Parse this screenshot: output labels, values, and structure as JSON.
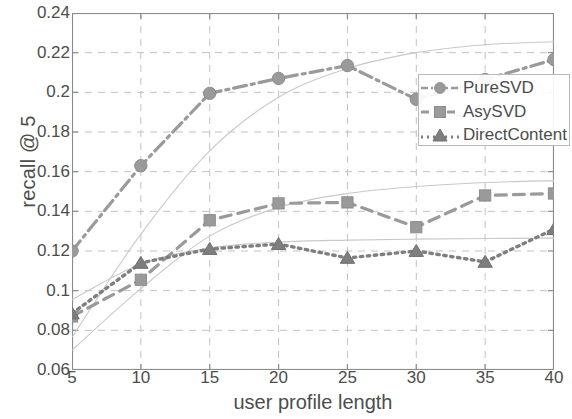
{
  "chart_data": {
    "type": "line",
    "title": "",
    "xlabel": "user profile length",
    "ylabel": "recall @ 5",
    "x": [
      5,
      10,
      15,
      20,
      25,
      30,
      35,
      40
    ],
    "xticklabels": [
      "5",
      "10",
      "15",
      "20",
      "25",
      "30",
      "35",
      "40"
    ],
    "yticklabels": [
      "0.06",
      "0.08",
      "0.1",
      "0.12",
      "0.14",
      "0.16",
      "0.18",
      "0.2",
      "0.22",
      "0.24"
    ],
    "yticks": [
      0.06,
      0.08,
      0.1,
      0.12,
      0.14,
      0.16,
      0.18,
      0.2,
      0.22,
      0.24
    ],
    "xlim": [
      5,
      40
    ],
    "ylim": [
      0.06,
      0.24
    ],
    "grid": true,
    "grid_style": "dashed",
    "legend_position": "upper-right",
    "series": [
      {
        "name": "PureSVD",
        "marker": "circle",
        "linestyle": "dashdot",
        "color": "#9a9a9a",
        "values": [
          0.12,
          0.163,
          0.1995,
          0.207,
          0.2135,
          0.1965,
          0.2065,
          0.2165
        ]
      },
      {
        "name": "AsySVD",
        "marker": "square",
        "linestyle": "dashed",
        "color": "#9a9a9a",
        "values": [
          0.087,
          0.1055,
          0.1355,
          0.144,
          0.1445,
          0.132,
          0.148,
          0.149
        ]
      },
      {
        "name": "DirectContent",
        "marker": "triangle",
        "linestyle": "dotted",
        "color": "#7e7e7e",
        "values": [
          0.0885,
          0.114,
          0.121,
          0.1235,
          0.1165,
          0.12,
          0.1145,
          0.131
        ]
      }
    ],
    "trend_curves": [
      {
        "name": "PureSVD-trend",
        "color": "#c9c9c9",
        "values": [
          0.0765,
          0.1285,
          0.1705,
          0.1975,
          0.212,
          0.22,
          0.224,
          0.2255
        ]
      },
      {
        "name": "AsySVD-trend",
        "color": "#c9c9c9",
        "values": [
          0.07,
          0.101,
          0.1275,
          0.142,
          0.149,
          0.1525,
          0.1545,
          0.1555
        ]
      },
      {
        "name": "DirectContent-trend",
        "color": "#c9c9c9",
        "values": [
          0.0955,
          0.1135,
          0.1215,
          0.1245,
          0.1255,
          0.126,
          0.1263,
          0.1265
        ]
      }
    ]
  },
  "axes": {
    "y_label": "recall @ 5",
    "x_label": "user profile length"
  },
  "legend": {
    "items": [
      {
        "label": "PureSVD"
      },
      {
        "label": "AsySVD"
      },
      {
        "label": "DirectContent"
      }
    ]
  },
  "colors": {
    "axis": "#8c8c8c",
    "grid": "#c2c2c2",
    "series_gray": "#9a9a9a",
    "series_dark": "#7e7e7e",
    "trend": "#c9c9c9",
    "text": "#4d4d4d",
    "background": "#ffffff"
  }
}
